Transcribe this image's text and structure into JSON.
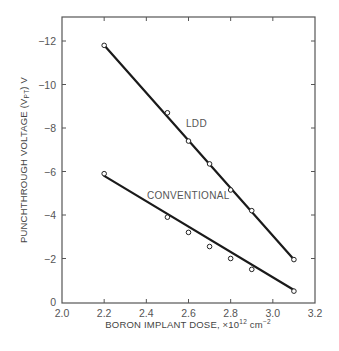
{
  "chart_data": {
    "type": "scatter",
    "title": "",
    "xlabel": "BORON IMPLANT DOSE, ×10¹² cm⁻²",
    "ylabel": "PUNCHTHROUGH VOLTAGE (Vₚₜ) V",
    "xlim": [
      2.0,
      3.2
    ],
    "ylim": [
      0,
      -13
    ],
    "x_ticks": [
      "2.0",
      "2.2",
      "2.4",
      "2.6",
      "2.8",
      "3.0",
      "3.2"
    ],
    "y_ticks": [
      "0",
      "−2",
      "−4",
      "−6",
      "−8",
      "−10",
      "−12"
    ],
    "grid": false,
    "legend": "none (series labelled inline)",
    "series": [
      {
        "name": "LDD",
        "x": [
          2.2,
          2.5,
          2.6,
          2.7,
          2.8,
          2.9,
          3.1
        ],
        "y": [
          -11.8,
          -8.7,
          -7.4,
          -6.35,
          -5.15,
          -4.2,
          -1.95
        ],
        "fit_line": {
          "x": [
            2.2,
            3.1
          ],
          "y": [
            -11.8,
            -1.95
          ]
        }
      },
      {
        "name": "CONVENTIONAL",
        "x": [
          2.2,
          2.5,
          2.6,
          2.7,
          2.8,
          2.9,
          3.1
        ],
        "y": [
          -5.9,
          -3.9,
          -3.2,
          -2.55,
          -2.0,
          -1.5,
          -0.5
        ],
        "fit_line": {
          "x": [
            2.2,
            3.1
          ],
          "y": [
            -5.8,
            -0.55
          ]
        }
      }
    ],
    "annotations": [
      "LDD",
      "CONVENTIONAL"
    ]
  },
  "labels": {
    "xlabel_main": "BORON IMPLANT DOSE, ×10",
    "xlabel_exp": "12",
    "xlabel_unit": " cm",
    "xlabel_unit_exp": "−2",
    "ylabel_main": "PUNCHTHROUGH VOLTAGE (V",
    "ylabel_sub": "PT",
    "ylabel_end": ") V",
    "ldd": "LDD",
    "conventional": "CONVENTIONAL"
  }
}
